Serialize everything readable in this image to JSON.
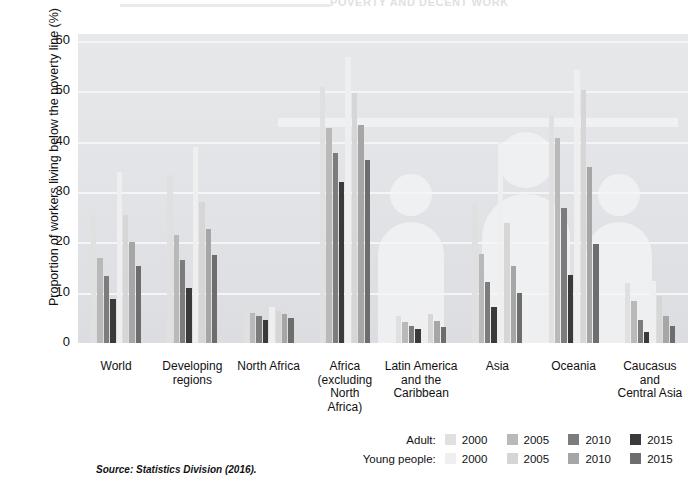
{
  "top": {
    "cropped_title": "POVERTY AND DECENT WORK"
  },
  "source_note": "Source: Statistics Division (2016).",
  "legend": {
    "rows": [
      {
        "title": "Adult:",
        "items": [
          {
            "label": "2000",
            "color": "#e0e0e0"
          },
          {
            "label": "2005",
            "color": "#b9b9b9"
          },
          {
            "label": "2010",
            "color": "#7c7c7c"
          },
          {
            "label": "2015",
            "color": "#3a3a3a"
          }
        ]
      },
      {
        "title": "Young people:",
        "items": [
          {
            "label": "2000",
            "color": "#efefef"
          },
          {
            "label": "2005",
            "color": "#d6d6d6"
          },
          {
            "label": "2010",
            "color": "#a6a6a6"
          },
          {
            "label": "2015",
            "color": "#6d6d6d"
          }
        ]
      }
    ]
  },
  "chart_data": {
    "type": "bar",
    "title": "",
    "xlabel": "",
    "ylabel": "Proportion of workers living below the poverty line (%)",
    "ylim": [
      0,
      60
    ],
    "yticks": [
      0,
      10,
      20,
      30,
      40,
      50,
      60
    ],
    "grid": true,
    "legend_position": "bottom-right",
    "categories": [
      "World",
      "Developing regions",
      "North Africa",
      "Africa (excluding North Africa)",
      "Latin America and the Caribbean",
      "Asia",
      "Oceania",
      "Caucasus and Central Asia"
    ],
    "category_lines": [
      [
        "World"
      ],
      [
        "Developing",
        "regions"
      ],
      [
        "North Africa"
      ],
      [
        "Africa",
        "(excluding",
        "North",
        "Africa)"
      ],
      [
        "Latin America",
        "and the",
        "Caribbean"
      ],
      [
        "Asia"
      ],
      [
        "Oceania"
      ],
      [
        "Caucasus",
        "and",
        "Central Asia"
      ]
    ],
    "series": [
      {
        "name": "Adult 2000",
        "group": "Adult",
        "year": "2000",
        "color": "#e0e0e0",
        "values": [
          25.5,
          33.3,
          6.8,
          50.8,
          5.4,
          27.6,
          45.3,
          11.9
        ]
      },
      {
        "name": "Adult 2005",
        "group": "Adult",
        "year": "2005",
        "color": "#b9b9b9",
        "values": [
          16.8,
          21.5,
          6.0,
          42.8,
          4.1,
          17.6,
          40.8,
          8.4
        ]
      },
      {
        "name": "Adult 2010",
        "group": "Adult",
        "year": "2010",
        "color": "#7c7c7c",
        "values": [
          13.4,
          16.4,
          5.3,
          37.7,
          3.3,
          12.2,
          26.8,
          4.6
        ]
      },
      {
        "name": "Adult 2015",
        "group": "Adult",
        "year": "2015",
        "color": "#3a3a3a",
        "values": [
          8.8,
          11.0,
          4.5,
          31.9,
          2.7,
          7.1,
          13.6,
          2.1
        ]
      },
      {
        "name": "Young people 2000",
        "group": "Young people",
        "year": "2000",
        "color": "#efefef",
        "values": [
          34.0,
          39.0,
          7.2,
          56.9,
          7.8,
          40.0,
          54.2,
          12.3
        ]
      },
      {
        "name": "Young people 2005",
        "group": "Young people",
        "year": "2005",
        "color": "#d6d6d6",
        "values": [
          25.5,
          28.0,
          6.3,
          49.6,
          5.8,
          23.8,
          50.3,
          9.4
        ]
      },
      {
        "name": "Young people 2010",
        "group": "Young people",
        "year": "2010",
        "color": "#a6a6a6",
        "values": [
          20.0,
          22.6,
          5.8,
          43.3,
          4.4,
          15.4,
          35.0,
          5.3
        ]
      },
      {
        "name": "Young people 2015",
        "group": "Young people",
        "year": "2015",
        "color": "#6d6d6d",
        "values": [
          15.4,
          17.4,
          4.9,
          36.3,
          3.1,
          10.0,
          19.6,
          3.4
        ]
      }
    ]
  }
}
